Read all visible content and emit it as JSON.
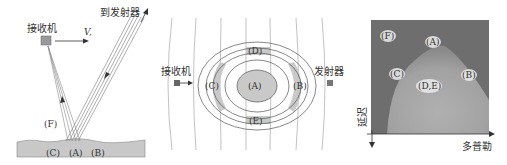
{
  "panels": {
    "left": {
      "receiver_label": "接收机",
      "velocity_label": "V,",
      "transmitter_label": "到发射器",
      "labels": {
        "F": "(F)",
        "C": "(C)",
        "A": "(A)",
        "B": "(B)"
      }
    },
    "middle": {
      "receiver_label": "接收机",
      "transmitter_label": "发射器",
      "labels": {
        "A": "(A)",
        "B": "(B)",
        "C": "(C)",
        "D": "(D)",
        "E": "(E)"
      }
    },
    "right": {
      "labels": {
        "F": "(F)",
        "A": "(A)",
        "C": "(C)",
        "B": "(B)",
        "DE": "(D,E)"
      },
      "y_axis_label": "延迟",
      "x_axis_label": "多普勒"
    }
  },
  "colors": {
    "ground": "#c8c8c8",
    "shade": "#c9c9c9",
    "line": "#555555",
    "image_dark": "#6e6e6e",
    "image_bright": "#bdbdbd"
  }
}
